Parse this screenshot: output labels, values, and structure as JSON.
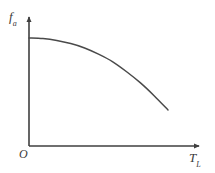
{
  "figure": {
    "background_color": "#ffffff",
    "line_color": "#4a4a4a",
    "axis_color": "#3f3f3f"
  },
  "labels": {
    "y_axis_symbol": "f",
    "y_axis_subscript": "a",
    "x_axis_symbol": "T",
    "x_axis_subscript": "L",
    "origin": "O"
  },
  "chart_data": {
    "type": "line",
    "title": "",
    "xlabel": "T_L",
    "ylabel": "f_a",
    "grid": false,
    "legend": null,
    "axes": {
      "x_arrow": true,
      "y_arrow": true,
      "origin_label": "O",
      "tick_labels_x": [],
      "tick_labels_y": [],
      "xlim": [
        0,
        1
      ],
      "ylim": [
        0,
        1
      ]
    },
    "series": [
      {
        "name": "f_a vs T_L",
        "shape": "monotonically decreasing, concave down",
        "x": [
          0.0,
          0.1,
          0.2,
          0.3,
          0.4,
          0.5,
          0.6,
          0.7,
          0.8,
          0.9,
          1.0
        ],
        "y": [
          1.0,
          0.995,
          0.98,
          0.955,
          0.92,
          0.87,
          0.81,
          0.73,
          0.64,
          0.535,
          0.42
        ]
      }
    ],
    "pixel_geometry": {
      "y_axis_x": 29,
      "y_axis_top": 16,
      "x_axis_y": 146,
      "x_axis_right": 201,
      "curve_start": [
        29,
        38
      ],
      "curve_end": [
        168,
        110
      ]
    }
  }
}
